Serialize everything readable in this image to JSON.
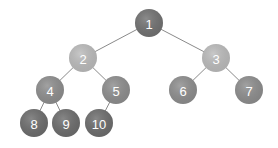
{
  "diagram": {
    "type": "binary-tree",
    "radius": 14,
    "nodes": [
      {
        "id": "1",
        "label": "1",
        "x": 149,
        "y": 23,
        "color": "#727272"
      },
      {
        "id": "2",
        "label": "2",
        "x": 83,
        "y": 58,
        "color": "#bcbcbc"
      },
      {
        "id": "3",
        "label": "3",
        "x": 216,
        "y": 58,
        "color": "#bcbcbc"
      },
      {
        "id": "4",
        "label": "4",
        "x": 50,
        "y": 90,
        "color": "#8e8e8e"
      },
      {
        "id": "5",
        "label": "5",
        "x": 116,
        "y": 90,
        "color": "#8e8e8e"
      },
      {
        "id": "6",
        "label": "6",
        "x": 183,
        "y": 90,
        "color": "#8e8e8e"
      },
      {
        "id": "7",
        "label": "7",
        "x": 249,
        "y": 90,
        "color": "#8e8e8e"
      },
      {
        "id": "8",
        "label": "8",
        "x": 34,
        "y": 123,
        "color": "#6d6d6d"
      },
      {
        "id": "9",
        "label": "9",
        "x": 66,
        "y": 123,
        "color": "#6d6d6d"
      },
      {
        "id": "10",
        "label": "10",
        "x": 99,
        "y": 123,
        "color": "#6d6d6d"
      }
    ],
    "edges": [
      [
        "1",
        "2"
      ],
      [
        "1",
        "3"
      ],
      [
        "2",
        "4"
      ],
      [
        "2",
        "5"
      ],
      [
        "3",
        "6"
      ],
      [
        "3",
        "7"
      ],
      [
        "4",
        "8"
      ],
      [
        "4",
        "9"
      ],
      [
        "5",
        "10"
      ]
    ]
  }
}
